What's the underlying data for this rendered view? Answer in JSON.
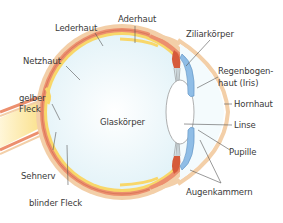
{
  "diagram": {
    "labels": {
      "aderhaut": "Aderhaut",
      "lederhaut": "Lederhaut",
      "netzhaut": "Netzhaut",
      "gelber_fleck_1": "gelber",
      "gelber_fleck_2": "Fleck",
      "sehnerv": "Sehnerv",
      "blinder_fleck": "blinder Fleck",
      "glaskoerper": "Glaskörper",
      "ziliarkoerper": "Ziliarkörper",
      "regenbogenhaut_1": "Regenbogen-",
      "regenbogenhaut_2": "haut (Iris)",
      "hornhaut": "Hornhaut",
      "linse": "Linse",
      "pupille": "Pupille",
      "augenkammern": "Augenkammern"
    },
    "colors": {
      "lederhaut": "#f3cfa8",
      "aderhaut": "#ec8f6e",
      "netzhaut": "#f8d76a",
      "glaskoerper": "#eaf6fa",
      "ziliarkoerper": "#d65a3a",
      "iris": "#8fbde6",
      "linse": "#ffffff",
      "hornhaut": "#f6e0c2",
      "leader_line": "#555555"
    }
  }
}
